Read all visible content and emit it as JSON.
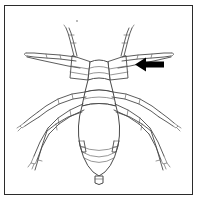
{
  "figure": {
    "kind": "scientific-line-drawing",
    "caption": "",
    "background_color": "#ffffff",
    "frame": {
      "border_color": "#2b2b2b",
      "border_width_px": 1,
      "x": 4,
      "y": 5,
      "width": 189,
      "height": 190
    },
    "line_art": {
      "stroke_color": "#4a4a4a",
      "light_stroke_color": "#6a6a6a",
      "fill_color": "#ffffff"
    },
    "annotation": {
      "marker": "arrow-left",
      "marker_color": "#000000",
      "label": "",
      "points_to": "antennal-tubercle",
      "x": 135,
      "y": 58,
      "width": 29,
      "height": 13
    },
    "parts": [
      {
        "name": "antenna-left",
        "label": ""
      },
      {
        "name": "antenna-right",
        "label": ""
      },
      {
        "name": "head",
        "label": ""
      },
      {
        "name": "antennal-tubercle",
        "label": ""
      },
      {
        "name": "thorax",
        "label": ""
      },
      {
        "name": "abdomen",
        "label": ""
      },
      {
        "name": "cornicle-left",
        "label": ""
      },
      {
        "name": "cornicle-right",
        "label": ""
      },
      {
        "name": "cauda",
        "label": ""
      },
      {
        "name": "foreleg-left",
        "label": ""
      },
      {
        "name": "foreleg-right",
        "label": ""
      },
      {
        "name": "midleg-left",
        "label": ""
      },
      {
        "name": "midleg-right",
        "label": ""
      },
      {
        "name": "hindleg-left",
        "label": ""
      },
      {
        "name": "hindleg-right",
        "label": ""
      }
    ]
  }
}
